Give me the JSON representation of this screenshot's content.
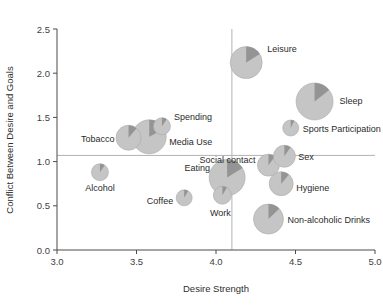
{
  "chart_data": {
    "type": "scatter",
    "title": "",
    "xlabel": "Desire Strength",
    "ylabel": "Conflict Between Desire and Goals",
    "xlim": [
      3.0,
      5.0
    ],
    "ylim": [
      0.0,
      2.5
    ],
    "xticks": [
      "3.0",
      "3.5",
      "4.0",
      "4.5",
      "5.0"
    ],
    "yticks": [
      "0.0",
      "0.5",
      "1.0",
      "1.5",
      "2.0",
      "2.5"
    ],
    "grid": false,
    "legend": "none",
    "marker_style": "pie",
    "marker_note": "Each point is a pie marker: light-gray disc with a darker-gray wedge; disc radius encodes a third variable (frequency / resistance magnitude).",
    "reference_lines": [
      {
        "name": "vertical-mean-line",
        "axis": "x",
        "value": 4.1
      },
      {
        "name": "horizontal-mean-line",
        "axis": "y",
        "value": 1.07
      }
    ],
    "points": [
      {
        "label": "Leisure",
        "x": 4.19,
        "y": 2.12,
        "r": 16.0,
        "wedge_start_deg": 0,
        "wedge_sweep_deg": 58,
        "label_dx": 21,
        "label_dy": -11,
        "label_anchor": "start"
      },
      {
        "label": "Sleep",
        "x": 4.62,
        "y": 1.68,
        "r": 18.5,
        "wedge_start_deg": 0,
        "wedge_sweep_deg": 52,
        "label_dx": 25,
        "label_dy": 3,
        "label_anchor": "start"
      },
      {
        "label": "Sports Participation",
        "x": 4.47,
        "y": 1.38,
        "r": 8.0,
        "wedge_start_deg": 0,
        "wedge_sweep_deg": 26,
        "label_dx": 12,
        "label_dy": 4,
        "label_anchor": "start"
      },
      {
        "label": "Spending",
        "x": 3.66,
        "y": 1.4,
        "r": 8.5,
        "wedge_start_deg": 0,
        "wedge_sweep_deg": 34,
        "label_dx": 12,
        "label_dy": -6,
        "label_anchor": "start"
      },
      {
        "label": "Media Use",
        "x": 3.58,
        "y": 1.28,
        "r": 17.0,
        "wedge_start_deg": 0,
        "wedge_sweep_deg": 62,
        "label_dx": 20,
        "label_dy": 8,
        "label_anchor": "start"
      },
      {
        "label": "Tobacco",
        "x": 3.45,
        "y": 1.27,
        "r": 12.5,
        "wedge_start_deg": 0,
        "wedge_sweep_deg": 40,
        "label_dx": -14,
        "label_dy": 4,
        "label_anchor": "end"
      },
      {
        "label": "Alcohol",
        "x": 3.27,
        "y": 0.88,
        "r": 8.5,
        "wedge_start_deg": 0,
        "wedge_sweep_deg": 34,
        "label_dx": 0,
        "label_dy": 19,
        "label_anchor": "middle"
      },
      {
        "label": "Coffee",
        "x": 3.8,
        "y": 0.59,
        "r": 8.0,
        "wedge_start_deg": 0,
        "wedge_sweep_deg": 30,
        "label_dx": -11,
        "label_dy": 6,
        "label_anchor": "end"
      },
      {
        "label": "Eating",
        "x": 4.07,
        "y": 0.82,
        "r": 18.0,
        "wedge_start_deg": 0,
        "wedge_sweep_deg": 58,
        "label_dx": -17,
        "label_dy": -7,
        "label_anchor": "end"
      },
      {
        "label": "Work",
        "x": 4.04,
        "y": 0.62,
        "r": 9.0,
        "wedge_start_deg": 0,
        "wedge_sweep_deg": 30,
        "label_dx": -2,
        "label_dy": 21,
        "label_anchor": "middle"
      },
      {
        "label": "Social contact",
        "x": 4.33,
        "y": 0.96,
        "r": 11.0,
        "wedge_start_deg": 0,
        "wedge_sweep_deg": 36,
        "label_dx": -13,
        "label_dy": -2,
        "label_anchor": "end"
      },
      {
        "label": "Sex",
        "x": 4.43,
        "y": 1.06,
        "r": 11.0,
        "wedge_start_deg": 0,
        "wedge_sweep_deg": 34,
        "label_dx": 14,
        "label_dy": 4,
        "label_anchor": "start"
      },
      {
        "label": "Hygiene",
        "x": 4.41,
        "y": 0.75,
        "r": 12.0,
        "wedge_start_deg": 0,
        "wedge_sweep_deg": 40,
        "label_dx": 15,
        "label_dy": 7,
        "label_anchor": "start"
      },
      {
        "label": "Non-alcoholic Drinks",
        "x": 4.33,
        "y": 0.35,
        "r": 15.0,
        "wedge_start_deg": 0,
        "wedge_sweep_deg": 46,
        "label_dx": 19,
        "label_dy": 4,
        "label_anchor": "start"
      }
    ]
  },
  "axes": {
    "x_title": "Desire Strength",
    "y_title": "Conflict Between Desire and Goals"
  }
}
